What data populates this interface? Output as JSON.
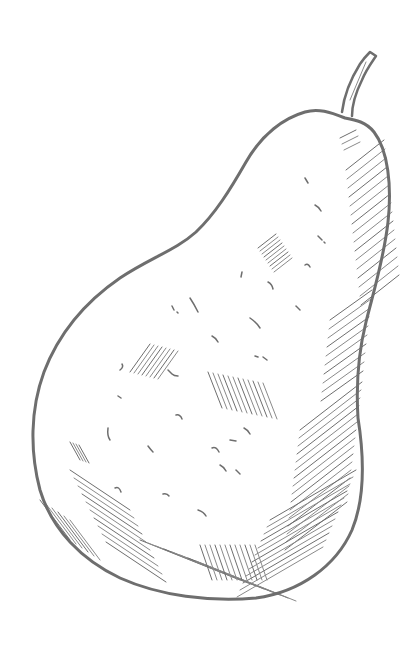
{
  "image": {
    "subject": "Hand-drawn pencil sketch of a pear",
    "background_color": "#ffffff",
    "stroke_color": "#6e6e6e",
    "light_stroke_color": "#8a8a8a"
  },
  "pear": {
    "outline": "M 345 118 C 330 112 318 108 305 112 C 284 118 262 134 246 162 C 230 190 215 214 196 232 C 176 250 150 258 120 278 C 88 300 60 330 44 372 C 30 410 30 452 40 490 C 52 530 82 560 120 578 C 160 596 210 602 256 598 C 300 592 336 566 352 530 C 366 496 364 456 358 418 C 356 386 358 354 366 322 C 374 290 384 258 388 222 C 392 186 388 150 374 132 C 366 122 356 120 345 118 Z",
    "stem": "M 342 112 C 344 96 350 80 360 64 C 364 58 368 54 370 52 L 376 56 C 372 62 366 70 362 80 C 356 92 352 104 352 116",
    "stem_highlight": "M 350 100 L 366 62"
  },
  "hatching": [
    {
      "x1": 340,
      "y1": 138,
      "x2": 356,
      "y2": 130,
      "count": 3,
      "dx": 2,
      "dy": 6
    },
    {
      "x1": 346,
      "y1": 170,
      "x2": 384,
      "y2": 140,
      "count": 16,
      "dx": 1,
      "dy": 9
    },
    {
      "x1": 330,
      "y1": 320,
      "x2": 372,
      "y2": 290,
      "count": 10,
      "dx": -1,
      "dy": 9
    },
    {
      "x1": 300,
      "y1": 430,
      "x2": 362,
      "y2": 382,
      "count": 16,
      "dx": -1,
      "dy": 8
    },
    {
      "x1": 270,
      "y1": 520,
      "x2": 356,
      "y2": 470,
      "count": 12,
      "dx": -3,
      "dy": 7
    },
    {
      "x1": 70,
      "y1": 470,
      "x2": 130,
      "y2": 510,
      "count": 10,
      "dx": 4,
      "dy": 8
    },
    {
      "x1": 140,
      "y1": 540,
      "x2": 240,
      "y2": 580,
      "count": 8,
      "dx": 8,
      "dy": 3
    },
    {
      "x1": 258,
      "y1": 248,
      "x2": 276,
      "y2": 234,
      "count": 9,
      "dx": 2,
      "dy": 3
    },
    {
      "x1": 130,
      "y1": 372,
      "x2": 150,
      "y2": 344,
      "count": 8,
      "dx": 4,
      "dy": 1
    },
    {
      "x1": 208,
      "y1": 372,
      "x2": 222,
      "y2": 408,
      "count": 12,
      "dx": 5,
      "dy": 1
    },
    {
      "x1": 70,
      "y1": 442,
      "x2": 80,
      "y2": 460,
      "count": 4,
      "dx": 3,
      "dy": 1
    },
    {
      "x1": 200,
      "y1": 545,
      "x2": 212,
      "y2": 580,
      "count": 12,
      "dx": 5,
      "dy": 0
    },
    {
      "x1": 40,
      "y1": 500,
      "x2": 70,
      "y2": 540,
      "count": 6,
      "dx": 6,
      "dy": 4
    }
  ],
  "specks": [
    "M 305 178 l 3 5",
    "M 315 205 q 4 2 6 6",
    "M 318 236 l 4 4 m 2 2 l 1 1",
    "M 305 265 q 3 -2 5 2",
    "M 242 272 l -1 5",
    "M 268 282 q 4 2 5 7",
    "M 296 306 l 4 4",
    "M 190 298 q 4 6 8 14",
    "M 172 306 l 2 4 m 3 2 l 1 1",
    "M 250 318 q 6 4 10 10",
    "M 212 336 q 4 2 6 6",
    "M 255 356 l 3 1 m 5 0 l 4 3",
    "M 122 364 q 2 3 -2 6",
    "M 168 370 l 4 4 q 2 2 6 2",
    "M 118 396 l 3 2",
    "M 176 415 q 4 -1 6 4",
    "M 108 428 q -1 8 2 12",
    "M 148 446 q 3 4 5 6",
    "M 212 448 q 4 -2 7 4",
    "M 230 440 l 6 1",
    "M 244 428 q 4 2 6 6",
    "M 220 465 q 4 2 6 6",
    "M 115 488 q 4 -2 6 4",
    "M 163 494 q 4 -1 6 2",
    "M 198 510 q 6 2 8 6",
    "M 236 470 l 4 4"
  ]
}
